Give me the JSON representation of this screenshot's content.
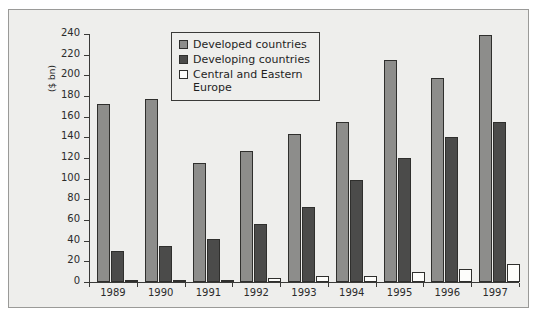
{
  "chart_data": {
    "type": "bar",
    "title": "",
    "subtitle": "",
    "xlabel": "",
    "ylabel": "($ bn)",
    "categories": [
      "1989",
      "1990",
      "1991",
      "1992",
      "1993",
      "1994",
      "1995",
      "1996",
      "1997"
    ],
    "series": [
      {
        "name": "Developed countries",
        "color": "#8d8d8b",
        "values": [
          172,
          177,
          115,
          127,
          143,
          155,
          215,
          197,
          239
        ]
      },
      {
        "name": "Developing countries",
        "color": "#4b4b4a",
        "values": [
          30,
          35,
          42,
          56,
          73,
          99,
          120,
          140,
          155
        ]
      },
      {
        "name": "Central and Eastern\nEurope",
        "color": "#ffffff",
        "values": [
          0.5,
          0.5,
          2,
          4,
          6,
          6,
          10,
          13,
          17
        ]
      }
    ],
    "ylim": [
      0,
      240
    ],
    "yticks": [
      0,
      20,
      40,
      60,
      80,
      100,
      120,
      140,
      160,
      180,
      200,
      220,
      240
    ],
    "grid": false,
    "legend_position": "top-center"
  },
  "legend": {
    "items": [
      {
        "label": "Developed countries",
        "swatch": "developed"
      },
      {
        "label": "Developing countries",
        "swatch": "developing"
      },
      {
        "label": "Central and Eastern\nEurope",
        "swatch": "cee"
      }
    ]
  }
}
